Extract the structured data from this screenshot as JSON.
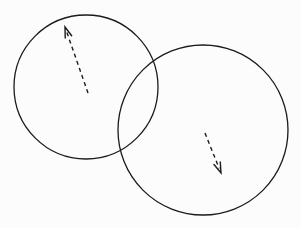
{
  "canvas": {
    "width": 301,
    "height": 228,
    "background_color": "#fcfcfc",
    "stroke_color": "#1a1a1a"
  },
  "chart_data": {
    "type": "diagram",
    "title": "",
    "subtitle": "",
    "xlabel": "",
    "ylabel": "",
    "grid": false,
    "legend": "none",
    "xlim": [
      0,
      301
    ],
    "ylim": [
      0,
      228
    ],
    "shapes": [
      {
        "name": "left-circle",
        "type": "circle",
        "cx": 86,
        "cy": 87,
        "r": 72,
        "fill": "none",
        "stroke": "#1a1a1a",
        "stroke_width": 1.3
      },
      {
        "name": "right-circle",
        "type": "circle",
        "cx": 203,
        "cy": 130,
        "r": 85,
        "fill": "none",
        "stroke": "#1a1a1a",
        "stroke_width": 1.3
      }
    ],
    "arrows": [
      {
        "name": "upper-left-arrow",
        "direction": "up-left",
        "dashed": true,
        "tail": [
          88,
          93
        ],
        "tip": [
          65,
          27
        ],
        "stroke": "#1a1a1a",
        "stroke_width": 1.4,
        "dash_pattern": "4 3.5",
        "head_length": 11,
        "head_half_angle_deg": 18,
        "inside_shape": "left-circle"
      },
      {
        "name": "lower-right-arrow",
        "direction": "down-right",
        "dashed": true,
        "tail": [
          205,
          133
        ],
        "tip": [
          221,
          173
        ],
        "stroke": "#1a1a1a",
        "stroke_width": 1.4,
        "dash_pattern": "4 3.5",
        "head_length": 11,
        "head_half_angle_deg": 18,
        "inside_shape": "right-circle"
      }
    ],
    "intersections": [
      {
        "name": "upper-intersection-point",
        "x": 152,
        "y": 62
      },
      {
        "name": "lower-intersection-point",
        "x": 122,
        "y": 158
      }
    ],
    "annotations": []
  }
}
